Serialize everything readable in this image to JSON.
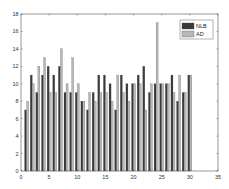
{
  "chart_data": {
    "type": "bar",
    "title": "",
    "xlabel": "",
    "ylabel": "",
    "x": [
      1,
      2,
      3,
      4,
      5,
      6,
      7,
      8,
      9,
      10,
      11,
      12,
      13,
      14,
      15,
      16,
      17,
      18,
      19,
      20,
      21,
      22,
      23,
      24,
      25,
      26,
      27,
      28,
      29,
      30
    ],
    "series": [
      {
        "name": "NLB",
        "color": "#3a3a3a",
        "values": [
          7,
          11,
          9,
          11,
          12,
          11,
          12,
          9,
          9,
          9,
          8,
          7,
          9,
          11,
          11,
          10,
          7,
          11,
          10,
          10,
          11,
          12,
          9,
          10,
          10,
          10,
          11,
          8,
          9,
          11
        ]
      },
      {
        "name": "AD",
        "color": "#b8b8b8",
        "values": [
          8,
          10,
          12,
          13,
          9,
          9,
          14,
          10,
          13,
          10,
          8,
          9,
          8,
          9,
          9,
          8,
          11,
          9,
          8,
          10,
          10,
          7,
          10,
          17,
          10,
          10,
          9,
          11,
          9,
          11
        ]
      }
    ],
    "xlim": [
      0,
      35
    ],
    "ylim": [
      0,
      18
    ],
    "xticks": [
      "0",
      "5",
      "10",
      "15",
      "20",
      "25",
      "30",
      "35"
    ],
    "yticks": [
      "0",
      "2",
      "4",
      "6",
      "8",
      "10",
      "12",
      "14",
      "16",
      "18"
    ],
    "grid": false,
    "legend_position": "upper right"
  }
}
